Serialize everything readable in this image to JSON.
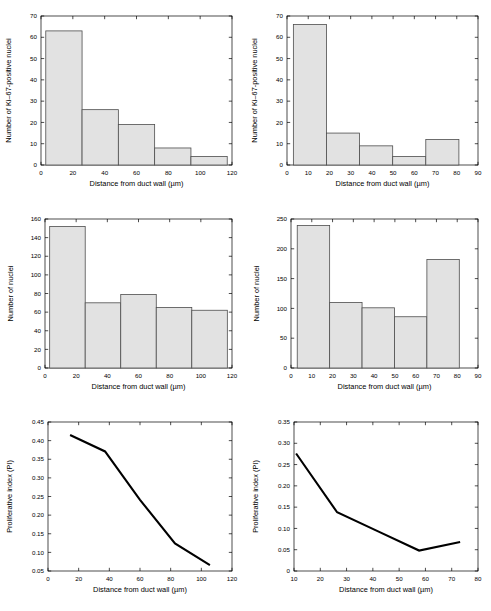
{
  "figure": {
    "title": "",
    "panel_count": 6,
    "background_color": "#ffffff",
    "bar_fill_color": "#e2e2e2",
    "bar_edge_color": "#4d4d4d",
    "line_color": "#000000",
    "axis_color": "#000000"
  },
  "labels": {
    "xlabel": "Distance from duct wall (µm)",
    "ylabel_ki67": "Number of Ki–67-positive nuclei",
    "ylabel_nuclei": "Number of nuclei",
    "ylabel_pi": "Proliferative index (PI)"
  },
  "chart_data": [
    {
      "id": "panel-top-left",
      "type": "bar",
      "title": "",
      "xlabel": "Distance from duct wall (µm)",
      "ylabel": "Number of Ki–67-positive nuclei",
      "xlim": [
        0,
        120
      ],
      "ylim": [
        0,
        70
      ],
      "xticks": [
        0,
        20,
        40,
        60,
        80,
        100,
        120
      ],
      "xticklabels": [
        "0",
        "20",
        "40",
        "60",
        "80",
        "100",
        "120"
      ],
      "yticks": [
        0,
        10,
        20,
        30,
        40,
        50,
        60,
        70
      ],
      "yticklabels": [
        "0",
        "10",
        "20",
        "30",
        "40",
        "50",
        "60",
        "70"
      ],
      "grid": false,
      "legend": false,
      "bin_edges": [
        3,
        25.8,
        48.6,
        71.4,
        94.2,
        117
      ],
      "categories": [
        "3–26",
        "26–49",
        "49–71",
        "71–94",
        "94–117"
      ],
      "values": [
        63,
        26,
        19,
        8,
        4
      ]
    },
    {
      "id": "panel-top-right",
      "type": "bar",
      "title": "",
      "xlabel": "Distance from duct wall (µm)",
      "ylabel": "Number of Ki–67-positive nuclei",
      "xlim": [
        0,
        90
      ],
      "ylim": [
        0,
        70
      ],
      "xticks": [
        0,
        10,
        20,
        30,
        40,
        50,
        60,
        70,
        80,
        90
      ],
      "xticklabels": [
        "0",
        "10",
        "20",
        "30",
        "40",
        "50",
        "60",
        "70",
        "80",
        "90"
      ],
      "yticks": [
        0,
        10,
        20,
        30,
        40,
        50,
        60,
        70
      ],
      "yticklabels": [
        "0",
        "10",
        "20",
        "30",
        "40",
        "50",
        "60",
        "70"
      ],
      "grid": false,
      "legend": false,
      "bin_edges": [
        3,
        18.6,
        34.2,
        49.8,
        65.4,
        81
      ],
      "categories": [
        "3–19",
        "19–34",
        "34–50",
        "50–65",
        "65–81"
      ],
      "values": [
        66,
        15,
        9,
        4,
        12
      ]
    },
    {
      "id": "panel-middle-left",
      "type": "bar",
      "title": "",
      "xlabel": "Distance from duct wall (µm)",
      "ylabel": "Number of nuclei",
      "xlim": [
        0,
        120
      ],
      "ylim": [
        0,
        160
      ],
      "xticks": [
        0,
        20,
        40,
        60,
        80,
        100,
        120
      ],
      "xticklabels": [
        "0",
        "20",
        "40",
        "60",
        "80",
        "100",
        "120"
      ],
      "yticks": [
        0,
        20,
        40,
        60,
        80,
        100,
        120,
        140,
        160
      ],
      "yticklabels": [
        "0",
        "20",
        "40",
        "60",
        "80",
        "100",
        "120",
        "140",
        "160"
      ],
      "grid": false,
      "legend": false,
      "bin_edges": [
        3,
        25.8,
        48.6,
        71.4,
        94.2,
        117
      ],
      "categories": [
        "3–26",
        "26–49",
        "49–71",
        "71–94",
        "94–117"
      ],
      "values": [
        152,
        70,
        79,
        65,
        62
      ]
    },
    {
      "id": "panel-middle-right",
      "type": "bar",
      "title": "",
      "xlabel": "Distance from duct wall (µm)",
      "ylabel": "Number of nuclei",
      "xlim": [
        0,
        90
      ],
      "ylim": [
        0,
        250
      ],
      "xticks": [
        0,
        10,
        20,
        30,
        40,
        50,
        60,
        70,
        80,
        90
      ],
      "xticklabels": [
        "0",
        "10",
        "20",
        "30",
        "40",
        "50",
        "60",
        "70",
        "80",
        "90"
      ],
      "yticks": [
        0,
        50,
        100,
        150,
        200,
        250
      ],
      "yticklabels": [
        "0",
        "50",
        "100",
        "150",
        "200",
        "250"
      ],
      "grid": false,
      "legend": false,
      "bin_edges": [
        3,
        18.6,
        34.2,
        49.8,
        65.4,
        81
      ],
      "categories": [
        "3–19",
        "19–34",
        "34–50",
        "50–65",
        "65–81"
      ],
      "values": [
        239,
        110,
        101,
        86,
        182
      ]
    },
    {
      "id": "panel-bottom-left",
      "type": "line",
      "title": "",
      "xlabel": "Distance from duct wall (µm)",
      "ylabel": "Proliferative index (PI)",
      "xlim": [
        0,
        120
      ],
      "ylim": [
        0.05,
        0.45
      ],
      "xticks": [
        0,
        20,
        40,
        60,
        80,
        100,
        120
      ],
      "xticklabels": [
        "0",
        "20",
        "40",
        "60",
        "80",
        "100",
        "120"
      ],
      "yticks": [
        0.05,
        0.1,
        0.15,
        0.2,
        0.25,
        0.3,
        0.35,
        0.4,
        0.45
      ],
      "yticklabels": [
        "0.05",
        "0.10",
        "0.15",
        "0.20",
        "0.25",
        "0.30",
        "0.35",
        "0.40",
        "0.45"
      ],
      "grid": false,
      "legend": false,
      "x": [
        14.4,
        37.2,
        60.0,
        82.8,
        105.6
      ],
      "y": [
        0.415,
        0.371,
        0.241,
        0.124,
        0.066
      ]
    },
    {
      "id": "panel-bottom-right",
      "type": "line",
      "title": "",
      "xlabel": "Distance from duct wall (µm)",
      "ylabel": "Proliferative index (PI)",
      "xlim": [
        10,
        80
      ],
      "ylim": [
        0,
        0.35
      ],
      "xticks": [
        10,
        20,
        30,
        40,
        50,
        60,
        70,
        80
      ],
      "xticklabels": [
        "10",
        "20",
        "30",
        "40",
        "50",
        "60",
        "70",
        "80"
      ],
      "yticks": [
        0,
        0.05,
        0.1,
        0.15,
        0.2,
        0.25,
        0.3,
        0.35
      ],
      "yticklabels": [
        "0",
        "0.05",
        "0.10",
        "0.15",
        "0.20",
        "0.25",
        "0.30",
        "0.35"
      ],
      "grid": false,
      "legend": false,
      "x": [
        10.8,
        26.4,
        42.0,
        57.6,
        73.2
      ],
      "y": [
        0.276,
        0.138,
        0.093,
        0.048,
        0.068
      ]
    }
  ]
}
